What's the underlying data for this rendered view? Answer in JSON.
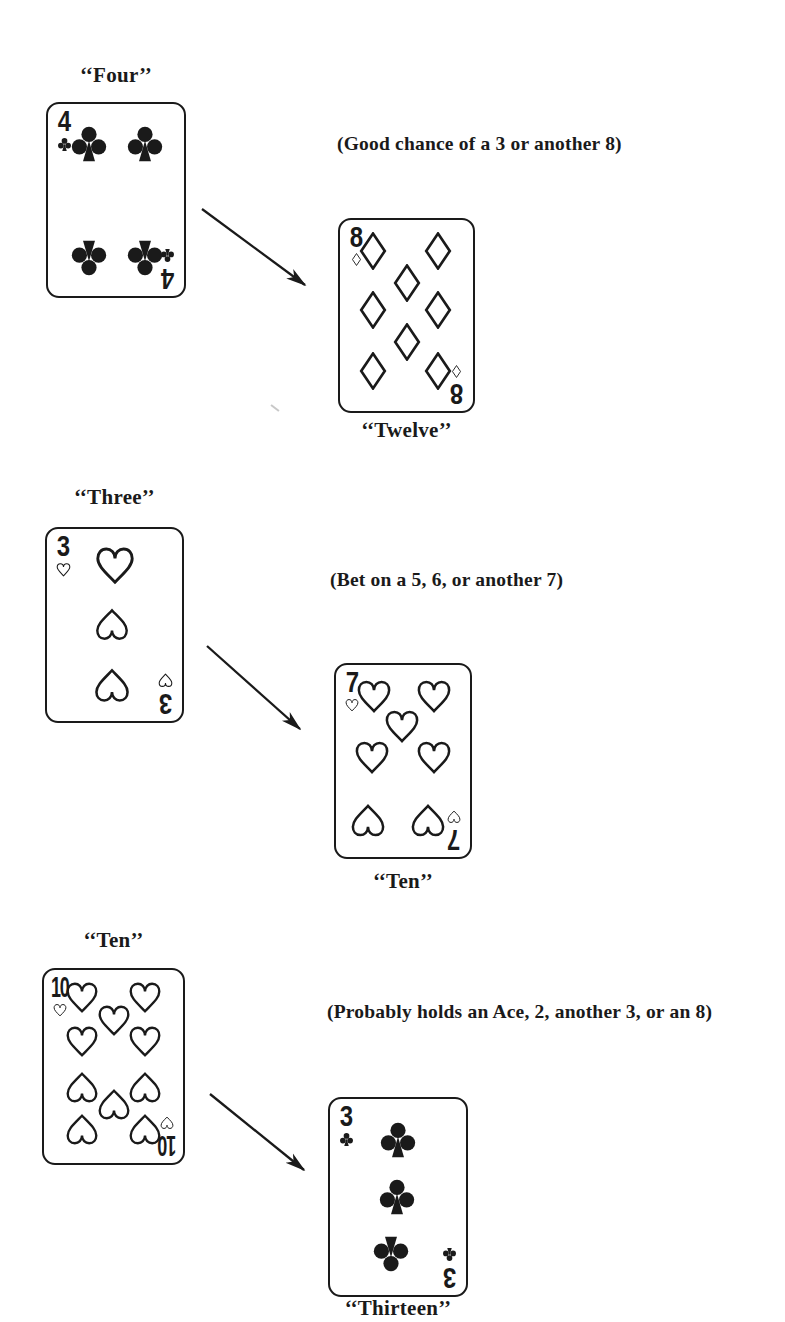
{
  "page": {
    "background": "#ffffff",
    "ink": "#1a1a1a"
  },
  "groups": [
    {
      "hand_label": "‘‘Four’’",
      "annotation": "(Good chance of a 3 or another 8)",
      "count_label": "‘‘Twelve’’",
      "hand_card": {
        "name": "four-of-clubs",
        "rank": "4",
        "suit": "clubs",
        "pip_style": "solid",
        "pip_size": 40,
        "index_pip_size": 15,
        "pips": [
          {
            "x": 30,
            "y": 21,
            "r": 0
          },
          {
            "x": 71,
            "y": 21,
            "r": 0
          },
          {
            "x": 30,
            "y": 80,
            "r": 180
          },
          {
            "x": 71,
            "y": 80,
            "r": 180
          }
        ]
      },
      "count_card": {
        "name": "eight-of-diamonds",
        "rank": "8",
        "suit": "diamonds",
        "pip_style": "outline",
        "pip_size": 38,
        "index_pip_size": 13,
        "pips": [
          {
            "x": 25,
            "y": 16,
            "r": 0
          },
          {
            "x": 74,
            "y": 16,
            "r": 0
          },
          {
            "x": 50,
            "y": 33,
            "r": 0
          },
          {
            "x": 25,
            "y": 47,
            "r": 0
          },
          {
            "x": 74,
            "y": 47,
            "r": 0
          },
          {
            "x": 50,
            "y": 64,
            "r": 0
          },
          {
            "x": 25,
            "y": 79,
            "r": 0
          },
          {
            "x": 74,
            "y": 79,
            "r": 0
          }
        ]
      }
    },
    {
      "hand_label": "‘‘Three’’",
      "annotation": "(Bet on a 5, 6, or another 7)",
      "count_label": "‘‘Ten’’",
      "hand_card": {
        "name": "three-of-hearts",
        "rank": "3",
        "suit": "hearts",
        "pip_style": "outline",
        "pip_size": 37,
        "index_pip_size": 15,
        "pips": [
          {
            "x": 50,
            "y": 19,
            "r": 0,
            "s": 1.12
          },
          {
            "x": 48,
            "y": 50,
            "r": 180,
            "s": 0.95
          },
          {
            "x": 48,
            "y": 82,
            "r": 180,
            "s": 1
          }
        ]
      },
      "count_card": {
        "name": "seven-of-hearts",
        "rank": "7",
        "suit": "hearts",
        "pip_style": "outline",
        "pip_size": 36,
        "index_pip_size": 14,
        "pips": [
          {
            "x": 28,
            "y": 16,
            "r": 0
          },
          {
            "x": 73,
            "y": 16,
            "r": 0
          },
          {
            "x": 49,
            "y": 32,
            "r": 0
          },
          {
            "x": 27,
            "y": 48,
            "r": 0
          },
          {
            "x": 73,
            "y": 48,
            "r": 0
          },
          {
            "x": 24,
            "y": 81,
            "r": 180
          },
          {
            "x": 69,
            "y": 81,
            "r": 180
          }
        ]
      }
    },
    {
      "hand_label": "‘‘Ten’’",
      "annotation": "(Probably holds an Ace, 2, another 3, or an 8)",
      "count_label": "‘‘Thirteen’’",
      "hand_card": {
        "name": "ten-of-hearts",
        "rank": "10",
        "suit": "hearts",
        "pip_style": "outline",
        "pip_size": 34,
        "index_pip_size": 14,
        "pips": [
          {
            "x": 27,
            "y": 14,
            "r": 0
          },
          {
            "x": 73,
            "y": 14,
            "r": 0
          },
          {
            "x": 50,
            "y": 26,
            "r": 0
          },
          {
            "x": 27,
            "y": 37,
            "r": 0
          },
          {
            "x": 73,
            "y": 37,
            "r": 0
          },
          {
            "x": 27,
            "y": 61,
            "r": 180
          },
          {
            "x": 73,
            "y": 61,
            "r": 180
          },
          {
            "x": 50,
            "y": 70,
            "r": 180
          },
          {
            "x": 27,
            "y": 83,
            "r": 180
          },
          {
            "x": 73,
            "y": 83,
            "r": 180
          }
        ]
      },
      "count_card": {
        "name": "three-of-clubs",
        "rank": "3",
        "suit": "clubs",
        "pip_style": "solid",
        "pip_size": 40,
        "index_pip_size": 15,
        "pips": [
          {
            "x": 50,
            "y": 21,
            "r": 0
          },
          {
            "x": 49,
            "y": 50,
            "r": 0
          },
          {
            "x": 45,
            "y": 79,
            "r": 180
          }
        ]
      }
    }
  ]
}
